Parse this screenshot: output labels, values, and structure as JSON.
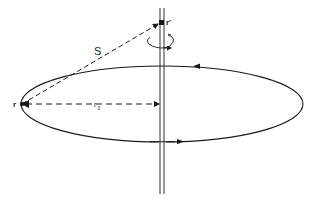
{
  "diagram": {
    "type": "physics-diagram",
    "labels": {
      "point_r": "r",
      "point_r_prime": "r'",
      "separation": "S",
      "radius": "r",
      "radius_subscript": "0"
    },
    "elements": [
      {
        "name": "current-loop",
        "kind": "ellipse",
        "direction": "counterclockwise (top arrow points left, bottom arrow points right)"
      },
      {
        "name": "wire",
        "kind": "vertical double line"
      },
      {
        "name": "separation-vector",
        "kind": "dashed arrow",
        "from": "r",
        "to": "r'",
        "label": "S"
      },
      {
        "name": "radius-vector",
        "kind": "dashed arrow",
        "from": "r",
        "to": "wire",
        "label": "r0"
      },
      {
        "name": "circulation-arrow",
        "kind": "curved arrow around wire"
      }
    ],
    "colors": {
      "stroke": "#1a1a1a",
      "background": "#ffffff"
    }
  }
}
